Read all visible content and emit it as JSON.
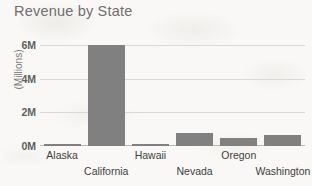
{
  "chart_data": {
    "type": "bar",
    "title": "Revenue by State",
    "xlabel": "",
    "ylabel": "(Millions)",
    "categories": [
      "Alaska",
      "California",
      "Hawaii",
      "Nevada",
      "Oregon",
      "Washington"
    ],
    "values": [
      0.06,
      6.0,
      0.07,
      0.77,
      0.5,
      0.65
    ],
    "ytick_labels": [
      "6M",
      "4M",
      "2M",
      "0M"
    ],
    "ytick_values": [
      6,
      4,
      2,
      0
    ],
    "ylim": [
      0,
      6
    ],
    "grid": true,
    "legend": "none",
    "bar_color": "#808080",
    "gridline_color": "#d9d8d4",
    "background_color": "#f9f8f6",
    "title_color": "#6f6f6d",
    "label_color": "#3f3f3d",
    "xtick_label_rows": [
      0,
      1,
      0,
      1,
      0,
      1
    ]
  }
}
